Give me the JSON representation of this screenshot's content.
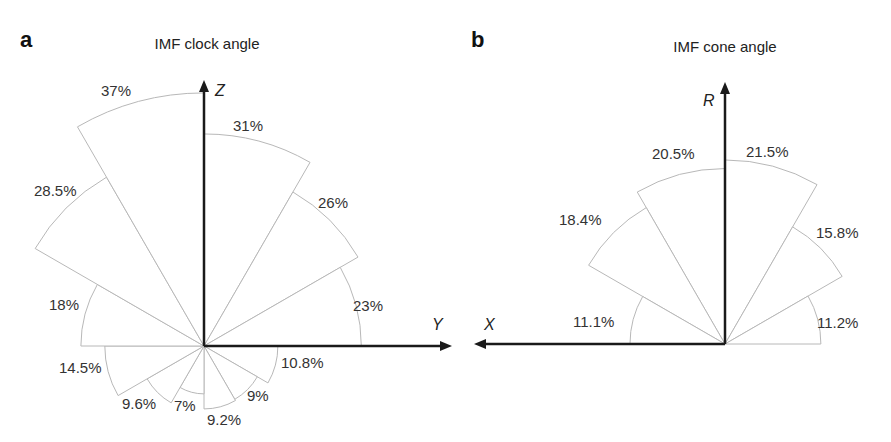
{
  "chart_data": [
    {
      "type": "rose",
      "panel": "a",
      "title": "IMF clock angle",
      "axes": {
        "vertical": "Z",
        "horizontal": "Y"
      },
      "sector_width_deg": 30,
      "angle_reference": "clockwise from +Z toward +Y",
      "categories": [
        "0-30",
        "30-60",
        "60-90",
        "90-120",
        "120-150",
        "150-180",
        "180-210",
        "210-240",
        "240-270",
        "270-300",
        "300-330",
        "330-360"
      ],
      "values": [
        31,
        26,
        23,
        10.8,
        9,
        9.2,
        7,
        9.6,
        14.5,
        18,
        28.5,
        37
      ],
      "labels": [
        "31%",
        "26%",
        "23%",
        "10.8%",
        "9%",
        "9.2%",
        "7%",
        "9.6%",
        "14.5%",
        "18%",
        "28.5%",
        "37%"
      ],
      "unit": "%"
    },
    {
      "type": "rose",
      "panel": "b",
      "title": "IMF cone angle",
      "axes": {
        "vertical": "R",
        "horizontal": "X"
      },
      "sector_width_deg": 30,
      "angle_reference": "from +R; right side positive, left side toward +X",
      "categories": [
        "0-30 right",
        "30-60 right",
        "60-90 right",
        "0-30 left",
        "30-60 left",
        "60-90 left"
      ],
      "values": [
        21.5,
        15.8,
        11.2,
        20.5,
        18.4,
        11.1
      ],
      "labels": [
        "21.5%",
        "15.8%",
        "11.2%",
        "20.5%",
        "18.4%",
        "11.1%"
      ],
      "unit": "%"
    }
  ],
  "panel_a": {
    "letter": "a",
    "title": "IMF clock angle",
    "axis_z": "Z",
    "axis_y": "Y",
    "labels": [
      "31%",
      "26%",
      "23%",
      "10.8%",
      "9%",
      "9.2%",
      "7%",
      "9.6%",
      "14.5%",
      "18%",
      "28.5%",
      "37%"
    ]
  },
  "panel_b": {
    "letter": "b",
    "title": "IMF cone angle",
    "axis_r": "R",
    "axis_x": "X",
    "labels": [
      "21.5%",
      "15.8%",
      "11.2%",
      "20.5%",
      "18.4%",
      "11.1%"
    ]
  }
}
